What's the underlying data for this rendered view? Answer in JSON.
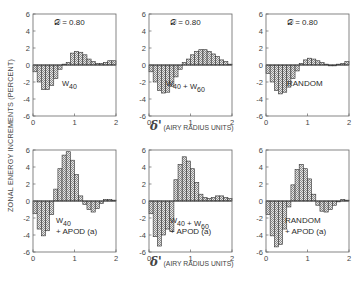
{
  "figure": {
    "ylabel": "ZONAL ENERGY INCREMENTS (PERCENT)",
    "xlabel_symbol": "δ'",
    "xlabel_text": "(AIRY RADIUS UNITS)",
    "colors": {
      "axis": "#555555",
      "bar_fill": "#bdbdbd",
      "bar_stroke": "#333333",
      "text": "#2a2a2a"
    }
  },
  "chart_data": [
    {
      "type": "bar",
      "panel": "top-left",
      "title": "𝒟 = 0.80",
      "annotation": [
        "W40"
      ],
      "x_edges_start": 0,
      "bin_width": 0.1,
      "values": [
        -0.8,
        -2.0,
        -2.9,
        -2.9,
        -2.4,
        -1.6,
        -0.5,
        0.1,
        0.3,
        1.4,
        1.6,
        1.5,
        1.2,
        0.7,
        0.4,
        0.2,
        0.2,
        0.3,
        0.5,
        0.5
      ],
      "xlim": [
        0,
        2
      ],
      "ylim": [
        -6,
        6
      ],
      "xticks": [
        "0",
        "1",
        "2"
      ],
      "yticks": [
        "6",
        "4",
        "2",
        "0",
        "-2",
        "-4",
        "-6"
      ]
    },
    {
      "type": "bar",
      "panel": "top-middle",
      "title": "𝒟 = 0.80",
      "annotation": [
        "W40 + W60"
      ],
      "x_edges_start": 0,
      "bin_width": 0.1,
      "values": [
        -0.8,
        -2.0,
        -3.0,
        -3.3,
        -3.2,
        -2.5,
        -1.4,
        -0.5,
        0.3,
        0.7,
        1.2,
        1.6,
        1.8,
        1.8,
        1.6,
        1.3,
        1.0,
        0.6,
        0.4,
        0.1
      ],
      "xlim": [
        0,
        2
      ],
      "ylim": [
        -6,
        6
      ],
      "xticks": [
        "0",
        "1",
        "2"
      ],
      "yticks": [
        "6",
        "4",
        "2",
        "0",
        "-2",
        "-4",
        "-6"
      ]
    },
    {
      "type": "bar",
      "panel": "top-right",
      "title": "𝒟 = 0.80",
      "annotation": [
        "RANDOM"
      ],
      "x_edges_start": 0,
      "bin_width": 0.1,
      "values": [
        -1.0,
        -2.0,
        -3.0,
        -3.4,
        -3.2,
        -2.6,
        -1.6,
        -0.7,
        0.2,
        0.6,
        0.8,
        0.7,
        0.5,
        0.3,
        0.1,
        -0.1,
        -0.1,
        0.1,
        0.2,
        0.4
      ],
      "xlim": [
        0,
        2
      ],
      "ylim": [
        -6,
        6
      ],
      "xticks": [
        "0",
        "1",
        "2"
      ],
      "yticks": [
        "6",
        "4",
        "2",
        "0",
        "-2",
        "-4",
        "-6"
      ]
    },
    {
      "type": "bar",
      "panel": "bottom-left",
      "title": "",
      "annotation": [
        "W40",
        "+ APOD (a)"
      ],
      "x_edges_start": 0,
      "bin_width": 0.1,
      "values": [
        -1.5,
        -3.3,
        -4.1,
        -3.5,
        -1.6,
        1.4,
        3.8,
        5.4,
        5.8,
        4.8,
        3.1,
        0.6,
        -0.4,
        -1.0,
        -1.3,
        -0.9,
        -0.3,
        0.2,
        0.2,
        0.1
      ],
      "xlim": [
        0,
        2
      ],
      "ylim": [
        -6,
        6
      ],
      "xticks": [
        "0",
        "1",
        "2"
      ],
      "yticks": [
        "6",
        "4",
        "2",
        "0",
        "-2",
        "-4",
        "-6"
      ]
    },
    {
      "type": "bar",
      "panel": "bottom-middle",
      "title": "",
      "annotation": [
        "W40 + W60",
        "+ APOD (a)"
      ],
      "x_edges_start": 0,
      "bin_width": 0.1,
      "values": [
        -1.5,
        -4.2,
        -5.3,
        -4.0,
        -3.3,
        -3.6,
        2.5,
        4.3,
        5.2,
        4.7,
        3.8,
        2.2,
        0.8,
        0.4,
        0.3,
        0.4,
        0.6,
        0.6,
        0.4,
        0.3
      ],
      "xlim": [
        0,
        2
      ],
      "ylim": [
        -6,
        6
      ],
      "xticks": [
        "0",
        "1",
        "2"
      ],
      "yticks": [
        "6",
        "4",
        "2",
        "0",
        "-2",
        "-4",
        "-6"
      ]
    },
    {
      "type": "bar",
      "panel": "bottom-right",
      "title": "",
      "annotation": [
        "RANDOM",
        "+ APOD (a)"
      ],
      "x_edges_start": 0,
      "bin_width": 0.1,
      "values": [
        -1.6,
        -4.1,
        -5.4,
        -5.1,
        -3.3,
        -0.7,
        1.9,
        3.7,
        4.3,
        3.8,
        2.6,
        0.8,
        -0.5,
        -1.2,
        -1.3,
        -1.0,
        -0.5,
        -0.1,
        0.2,
        0.1
      ],
      "xlim": [
        0,
        2
      ],
      "ylim": [
        -6,
        6
      ],
      "xticks": [
        "0",
        "1",
        "2"
      ],
      "yticks": [
        "6",
        "4",
        "2",
        "0",
        "-2",
        "-4",
        "-6"
      ]
    }
  ]
}
